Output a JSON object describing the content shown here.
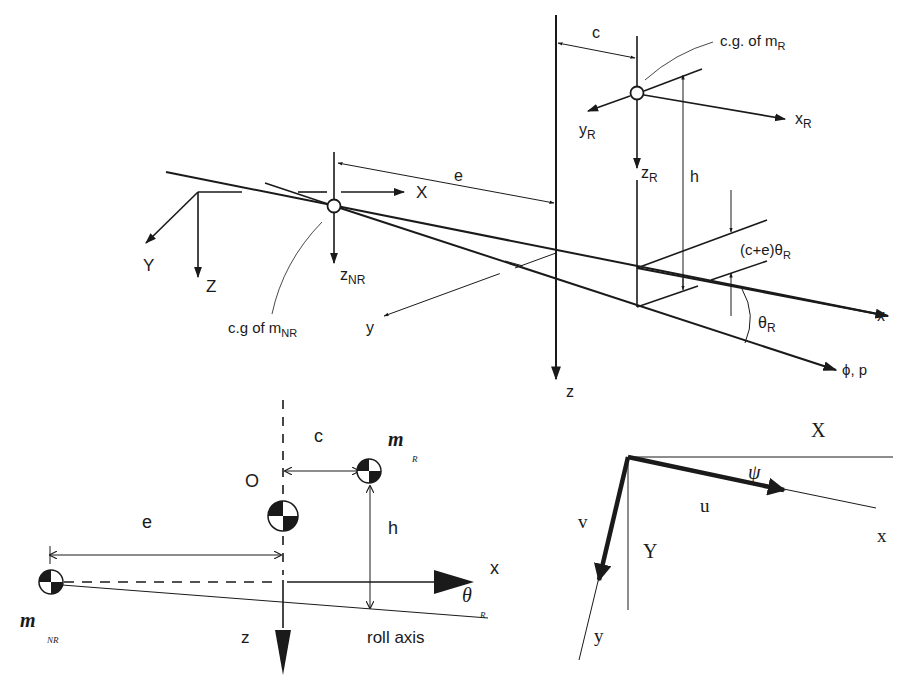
{
  "figure": {
    "top_diagram": {
      "label_c": "c",
      "label_cg_mR": "c.g. of m",
      "label_cg_mR_sub": "R",
      "label_xR": "x",
      "label_xR_sub": "R",
      "label_yR": "y",
      "label_yR_sub": "R",
      "label_zR": "z",
      "label_zR_sub": "R",
      "label_h": "h",
      "label_e": "e",
      "label_X": "X",
      "label_Y": "Y",
      "label_Z": "Z",
      "label_zNR": "z",
      "label_zNR_sub": "NR",
      "label_cg_mNR": "c.g of m",
      "label_cg_mNR_sub": "NR",
      "label_y": "y",
      "label_z": "z",
      "label_x": "x",
      "label_ce_theta": "(c+e)θ",
      "label_ce_theta_sub": "R",
      "label_thetaR": "θ",
      "label_thetaR_sub": "R",
      "label_phi_p": "ϕ, p"
    },
    "bottom_left_diagram": {
      "label_c": "c",
      "label_mR": "m",
      "label_mR_sub": "R",
      "label_O": "O",
      "label_e": "e",
      "label_h": "h",
      "label_x": "x",
      "label_theta": "θ",
      "label_theta_sub": "R",
      "label_mNR": "m",
      "label_mNR_sub": "NR",
      "label_z": "z",
      "label_roll_axis": "roll axis"
    },
    "bottom_right_diagram": {
      "label_X": "X",
      "label_psi": "ψ",
      "label_u": "u",
      "label_v": "v",
      "label_Y": "Y",
      "label_x": "x",
      "label_y": "y"
    }
  }
}
